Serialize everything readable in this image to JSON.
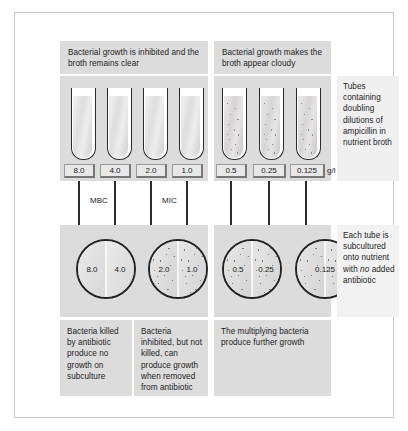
{
  "captions": {
    "left_header": "Bacterial growth is inhibited and the broth remains clear",
    "right_header": "Bacterial growth makes the broth appear cloudy",
    "bottom_a": "Bacteria killed by antibiotic produce no growth on subculture",
    "bottom_b": "Bacteria inhibited, but not killed, can produce growth when removed from antibiotic",
    "bottom_c": "The multiplying bacteria produce further growth"
  },
  "notes": {
    "tubes_note_part1": "Tubes containing doubling dilutions of ampicillin in nutrient broth",
    "subculture_note_part1": "Each tube is subcultured onto nutrient with ",
    "subculture_note_emphasis": "no",
    "subculture_note_part2": " added antibiotic"
  },
  "units": {
    "concentration": "g/l"
  },
  "markers": {
    "mbc": "MBC",
    "mic": "MIC"
  },
  "tubes": [
    {
      "concentration": "8.0",
      "appearance": "clear",
      "group": "left"
    },
    {
      "concentration": "4.0",
      "appearance": "clear",
      "group": "left"
    },
    {
      "concentration": "2.0",
      "appearance": "clear",
      "group": "left"
    },
    {
      "concentration": "1.0",
      "appearance": "clear",
      "group": "left"
    },
    {
      "concentration": "0.5",
      "appearance": "cloudy",
      "group": "right"
    },
    {
      "concentration": "0.25",
      "appearance": "cloudy",
      "group": "right"
    },
    {
      "concentration": "0.125",
      "appearance": "cloudy",
      "group": "right"
    }
  ],
  "dishes": [
    {
      "left_label": "8.0",
      "right_label": "4.0",
      "left_growth": false,
      "right_growth": false,
      "group": "left"
    },
    {
      "left_label": "2.0",
      "right_label": "1.0",
      "left_growth": true,
      "right_growth": true,
      "group": "left"
    },
    {
      "left_label": "0.5",
      "right_label": "0.25",
      "left_growth": true,
      "right_growth": true,
      "group": "right"
    },
    {
      "left_label": "",
      "right_label": "0.125",
      "left_growth": true,
      "right_growth": true,
      "group": "right",
      "clipped": true
    }
  ],
  "colors": {
    "panel": "#dcdcdc",
    "note_panel": "#f0f0f0",
    "outline": "#2b2b2b",
    "text": "#1d1d1d",
    "frame": "#c9c9c9"
  }
}
